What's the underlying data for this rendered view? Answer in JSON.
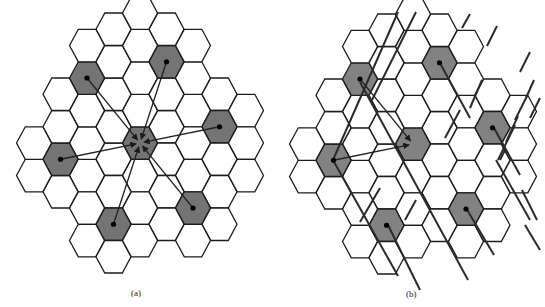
{
  "figure": {
    "hex": {
      "half_width": 17.5,
      "col_step": 26.5,
      "row_step": 32.5
    },
    "colors": {
      "line": "#1c1c1c",
      "cochannel_a": "#747474",
      "cochannel_b": "#828282",
      "background": "#ffffff"
    },
    "panels": [
      {
        "id": "a",
        "caption": "(a)",
        "caption_pos": [
          131,
          294
        ],
        "origin": [
          140,
          143
        ],
        "description": "Hexagonal cellular layout; six first-tier co-channel cells interfere with the central cell (direct paths)",
        "cells": [
          [
            0,
            0
          ],
          [
            1,
            -0.5
          ],
          [
            1,
            0.5
          ],
          [
            0,
            1
          ],
          [
            -1,
            0.5
          ],
          [
            -1,
            -0.5
          ],
          [
            0,
            -1
          ],
          [
            0,
            -2
          ],
          [
            1,
            -1.5
          ],
          [
            2,
            -1
          ],
          [
            2,
            0
          ],
          [
            2,
            1
          ],
          [
            1,
            1.5
          ],
          [
            0,
            2
          ],
          [
            -1,
            1.5
          ],
          [
            -2,
            1
          ],
          [
            -2,
            0
          ],
          [
            -2,
            -1
          ],
          [
            -1,
            -1.5
          ],
          [
            1,
            -2.5
          ],
          [
            2,
            -2
          ],
          [
            3,
            -1.5
          ],
          [
            3,
            -0.5
          ],
          [
            3,
            0.5
          ],
          [
            3,
            1.5
          ],
          [
            2,
            2
          ],
          [
            1,
            2.5
          ],
          [
            -1,
            2.5
          ],
          [
            -2,
            2
          ],
          [
            -3,
            1.5
          ],
          [
            -3,
            0.5
          ],
          [
            -3,
            -0.5
          ],
          [
            -3,
            -1.5
          ],
          [
            -2,
            -2
          ],
          [
            -1,
            -2.5
          ],
          [
            2,
            -3
          ],
          [
            1,
            -3.5
          ],
          [
            0,
            -3
          ],
          [
            -1,
            -3.5
          ],
          [
            4,
            -1
          ],
          [
            4,
            0
          ],
          [
            3,
            2.5
          ],
          [
            2,
            3
          ],
          [
            -2,
            3
          ],
          [
            -1,
            3.5
          ],
          [
            0,
            3
          ],
          [
            -4,
            1
          ],
          [
            -4,
            0
          ],
          [
            -2,
            -3
          ],
          [
            4,
            1
          ],
          [
            0,
            -4
          ]
        ],
        "cochannel": [
          [
            0,
            0
          ],
          [
            -2,
            -2
          ],
          [
            1,
            -2.5
          ],
          [
            3,
            -0.5
          ],
          [
            -3,
            0.5
          ],
          [
            2,
            2
          ],
          [
            -1,
            2.5
          ]
        ],
        "target": [
          0,
          0
        ],
        "rays_from": [
          [
            -2,
            -2
          ],
          [
            1,
            -2.5
          ],
          [
            3,
            -0.5
          ],
          [
            -3,
            0.5
          ],
          [
            2,
            2
          ],
          [
            -1,
            2.5
          ]
        ]
      },
      {
        "id": "b",
        "caption": "(b)",
        "caption_pos": [
          410,
          296
        ],
        "origin": [
          413,
          144
        ],
        "description": "Same layout with directional obstructions (diagonal walls) blocking most interference paths; only two co-channel cells reach the central cell",
        "cells": [
          [
            0,
            0
          ],
          [
            1,
            -0.5
          ],
          [
            1,
            0.5
          ],
          [
            0,
            1
          ],
          [
            -1,
            0.5
          ],
          [
            -1,
            -0.5
          ],
          [
            0,
            -1
          ],
          [
            0,
            -2
          ],
          [
            1,
            -1.5
          ],
          [
            2,
            -1
          ],
          [
            2,
            0
          ],
          [
            2,
            1
          ],
          [
            1,
            1.5
          ],
          [
            0,
            2
          ],
          [
            -1,
            1.5
          ],
          [
            -2,
            1
          ],
          [
            -2,
            0
          ],
          [
            -2,
            -1
          ],
          [
            -1,
            -1.5
          ],
          [
            1,
            -2.5
          ],
          [
            2,
            -2
          ],
          [
            3,
            -1.5
          ],
          [
            3,
            -0.5
          ],
          [
            3,
            0.5
          ],
          [
            3,
            1.5
          ],
          [
            2,
            2
          ],
          [
            1,
            2.5
          ],
          [
            -1,
            2.5
          ],
          [
            -2,
            2
          ],
          [
            -3,
            1.5
          ],
          [
            -3,
            0.5
          ],
          [
            -3,
            -0.5
          ],
          [
            -3,
            -1.5
          ],
          [
            -2,
            -2
          ],
          [
            -1,
            -2.5
          ],
          [
            2,
            -3
          ],
          [
            1,
            -3.5
          ],
          [
            0,
            -3
          ],
          [
            -1,
            -3.5
          ],
          [
            4,
            -1
          ],
          [
            4,
            0
          ],
          [
            3,
            2.5
          ],
          [
            2,
            3
          ],
          [
            -2,
            3
          ],
          [
            -1,
            3.5
          ],
          [
            0,
            3
          ],
          [
            -4,
            1
          ],
          [
            -4,
            0
          ],
          [
            -2,
            -3
          ],
          [
            4,
            1
          ],
          [
            0,
            -4
          ]
        ],
        "cochannel": [
          [
            0,
            0
          ],
          [
            -2,
            -2
          ],
          [
            1,
            -2.5
          ],
          [
            3,
            -0.5
          ],
          [
            -3,
            0.5
          ],
          [
            2,
            2
          ],
          [
            -1,
            2.5
          ]
        ],
        "target": [
          0,
          0
        ],
        "rays_from": [
          [
            -2,
            -2
          ],
          [
            -3,
            0.5
          ]
        ],
        "walls": [
          [
            398,
            12,
            333,
            160
          ],
          [
            416,
            12,
            372,
            100
          ],
          [
            333,
            160,
            398,
            276
          ],
          [
            360,
            82,
            468,
            280
          ],
          [
            441,
            65,
            470,
            118
          ],
          [
            387,
            223,
            420,
            290
          ],
          [
            466,
            208,
            494,
            255
          ],
          [
            494,
            128,
            520,
            175
          ],
          [
            470,
            14,
            462,
            28
          ],
          [
            497,
            26,
            487,
            46
          ],
          [
            530,
            52,
            520,
            72
          ],
          [
            534,
            80,
            526,
            98
          ],
          [
            527,
            96,
            515,
            120
          ],
          [
            518,
            116,
            506,
            142
          ],
          [
            482,
            80,
            470,
            108
          ],
          [
            460,
            110,
            445,
            138
          ],
          [
            380,
            188,
            360,
            222
          ],
          [
            416,
            200,
            405,
            220
          ],
          [
            540,
            98,
            530,
            118
          ],
          [
            515,
            125,
            498,
            160
          ],
          [
            505,
            150,
            500,
            160
          ],
          [
            496,
            160,
            530,
            220
          ],
          [
            522,
            190,
            537,
            220
          ],
          [
            525,
            225,
            540,
            250
          ]
        ]
      }
    ]
  }
}
